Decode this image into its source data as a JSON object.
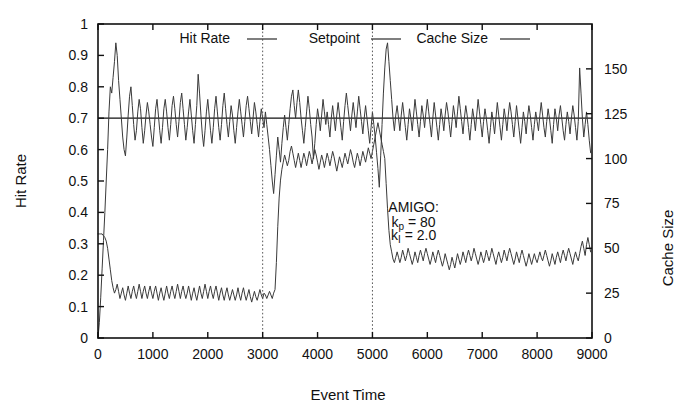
{
  "chart_data": {
    "type": "line",
    "title": "",
    "xlabel": "Event Time",
    "ylabel": "Hit Rate",
    "y2label": "Cache Size",
    "xlim": [
      0,
      9000
    ],
    "ylim": [
      0,
      1
    ],
    "y2lim": [
      0,
      175
    ],
    "xticks": [
      0,
      1000,
      2000,
      3000,
      4000,
      5000,
      6000,
      7000,
      8000,
      9000
    ],
    "xtick_labels": [
      "0",
      "1000",
      "2000",
      "3000",
      "4000",
      "5000",
      "6000",
      "7000",
      "8000",
      "9000"
    ],
    "yticks": [
      0,
      0.1,
      0.2,
      0.3,
      0.4,
      0.5,
      0.6,
      0.7,
      0.8,
      0.9,
      1
    ],
    "ytick_labels": [
      "0",
      "0.1",
      "0.2",
      "0.3",
      "0.4",
      "0.5",
      "0.6",
      "0.7",
      "0.8",
      "0.9",
      "1"
    ],
    "y2ticks": [
      0,
      25,
      50,
      75,
      100,
      125,
      150
    ],
    "y2tick_labels": [
      "0",
      "25",
      "50",
      "75",
      "100",
      "125",
      "150"
    ],
    "grid": false,
    "legend_position": "top-inside",
    "legend": [
      {
        "name": "Hit Rate",
        "marker": "line",
        "color": "#3a3a3a"
      },
      {
        "name": "Setpoint",
        "marker": "line",
        "color": "#111111"
      },
      {
        "name": "Cache Size",
        "marker": "line",
        "color": "#3a3a3a"
      }
    ],
    "annotations": [
      {
        "text": "AMIGO:",
        "x": 5750,
        "y": 0.4
      },
      {
        "text": "kp = 80",
        "x": 5750,
        "y": 0.355
      },
      {
        "text": "kI = 2.0",
        "x": 5750,
        "y": 0.312
      }
    ],
    "event_markers": [
      {
        "x": 3000,
        "style": "dotted"
      },
      {
        "x": 5000,
        "style": "dotted"
      }
    ],
    "setpoint_value": 0.7,
    "series": [
      {
        "name": "Setpoint",
        "axis": "left",
        "color": "#111111",
        "x": [
          0,
          9000
        ],
        "values": [
          0.7,
          0.7
        ]
      },
      {
        "name": "Hit Rate",
        "axis": "left",
        "color": "#3a3a3a",
        "x_start": 0,
        "x_step": 25,
        "values": [
          0.0,
          0.05,
          0.13,
          0.22,
          0.31,
          0.4,
          0.5,
          0.6,
          0.72,
          0.8,
          0.78,
          0.83,
          0.88,
          0.94,
          0.9,
          0.82,
          0.76,
          0.7,
          0.64,
          0.6,
          0.58,
          0.64,
          0.71,
          0.77,
          0.8,
          0.74,
          0.68,
          0.63,
          0.66,
          0.72,
          0.76,
          0.73,
          0.67,
          0.62,
          0.66,
          0.71,
          0.75,
          0.72,
          0.68,
          0.64,
          0.61,
          0.67,
          0.73,
          0.76,
          0.71,
          0.66,
          0.62,
          0.67,
          0.73,
          0.76,
          0.72,
          0.67,
          0.63,
          0.68,
          0.74,
          0.77,
          0.73,
          0.68,
          0.64,
          0.69,
          0.75,
          0.78,
          0.73,
          0.68,
          0.63,
          0.67,
          0.72,
          0.76,
          0.71,
          0.66,
          0.62,
          0.68,
          0.74,
          0.84,
          0.78,
          0.71,
          0.65,
          0.61,
          0.66,
          0.72,
          0.76,
          0.71,
          0.66,
          0.62,
          0.67,
          0.73,
          0.77,
          0.72,
          0.67,
          0.63,
          0.68,
          0.74,
          0.78,
          0.73,
          0.68,
          0.64,
          0.69,
          0.74,
          0.71,
          0.66,
          0.62,
          0.67,
          0.72,
          0.76,
          0.72,
          0.68,
          0.64,
          0.69,
          0.74,
          0.77,
          0.73,
          0.69,
          0.65,
          0.7,
          0.75,
          0.72,
          0.68,
          0.64,
          0.69,
          0.73,
          0.7,
          0.67,
          0.72,
          0.68,
          0.64,
          0.6,
          0.55,
          0.5,
          0.46,
          0.52,
          0.58,
          0.64,
          0.6,
          0.56,
          0.62,
          0.67,
          0.71,
          0.67,
          0.63,
          0.68,
          0.73,
          0.77,
          0.79,
          0.74,
          0.7,
          0.75,
          0.79,
          0.75,
          0.7,
          0.66,
          0.62,
          0.67,
          0.72,
          0.77,
          0.73,
          0.68,
          0.64,
          0.57,
          0.62,
          0.68,
          0.73,
          0.7,
          0.66,
          0.71,
          0.76,
          0.72,
          0.68,
          0.72,
          0.68,
          0.64,
          0.7,
          0.74,
          0.7,
          0.66,
          0.71,
          0.75,
          0.71,
          0.67,
          0.63,
          0.69,
          0.74,
          0.78,
          0.74,
          0.7,
          0.66,
          0.71,
          0.75,
          0.71,
          0.67,
          0.72,
          0.77,
          0.73,
          0.69,
          0.65,
          0.7,
          0.74,
          0.7,
          0.66,
          0.62,
          0.67,
          0.72,
          0.68,
          0.64,
          0.59,
          0.54,
          0.48,
          0.58,
          0.68,
          0.78,
          0.86,
          0.92,
          0.94,
          0.88,
          0.82,
          0.76,
          0.7,
          0.66,
          0.71,
          0.74,
          0.7,
          0.66,
          0.71,
          0.75,
          0.71,
          0.67,
          0.63,
          0.68,
          0.73,
          0.7,
          0.66,
          0.71,
          0.76,
          0.72,
          0.68,
          0.64,
          0.69,
          0.74,
          0.71,
          0.67,
          0.72,
          0.76,
          0.72,
          0.68,
          0.64,
          0.7,
          0.75,
          0.71,
          0.67,
          0.63,
          0.68,
          0.73,
          0.7,
          0.66,
          0.71,
          0.75,
          0.72,
          0.68,
          0.64,
          0.69,
          0.74,
          0.71,
          0.67,
          0.72,
          0.77,
          0.73,
          0.69,
          0.65,
          0.7,
          0.74,
          0.71,
          0.67,
          0.63,
          0.68,
          0.73,
          0.7,
          0.66,
          0.71,
          0.76,
          0.72,
          0.68,
          0.64,
          0.69,
          0.73,
          0.7,
          0.66,
          0.62,
          0.67,
          0.72,
          0.69,
          0.65,
          0.7,
          0.75,
          0.71,
          0.67,
          0.63,
          0.68,
          0.73,
          0.7,
          0.66,
          0.71,
          0.75,
          0.72,
          0.68,
          0.64,
          0.69,
          0.74,
          0.7,
          0.66,
          0.62,
          0.67,
          0.72,
          0.69,
          0.65,
          0.7,
          0.74,
          0.71,
          0.67,
          0.63,
          0.68,
          0.72,
          0.69,
          0.66,
          0.71,
          0.75,
          0.71,
          0.67,
          0.64,
          0.69,
          0.73,
          0.7,
          0.66,
          0.62,
          0.68,
          0.73,
          0.7,
          0.66,
          0.71,
          0.74,
          0.7,
          0.66,
          0.63,
          0.68,
          0.72,
          0.69,
          0.65,
          0.7,
          0.74,
          0.71,
          0.67,
          0.63,
          0.69,
          0.86,
          0.78,
          0.7,
          0.64,
          0.68,
          0.72,
          0.68,
          0.63,
          0.59
        ]
      },
      {
        "name": "Cache Size",
        "axis": "right",
        "color": "#3a3a3a",
        "x_start": 0,
        "x_step": 25,
        "values": [
          58,
          58,
          58,
          58,
          57,
          56,
          54,
          50,
          44,
          38,
          32,
          28,
          25,
          27,
          30,
          26,
          22,
          25,
          28,
          24,
          21,
          25,
          29,
          25,
          22,
          26,
          29,
          25,
          22,
          26,
          30,
          26,
          22,
          26,
          29,
          25,
          22,
          26,
          29,
          25,
          22,
          26,
          29,
          25,
          21,
          25,
          28,
          24,
          21,
          25,
          29,
          25,
          22,
          26,
          29,
          25,
          22,
          26,
          30,
          26,
          22,
          26,
          29,
          25,
          22,
          25,
          29,
          25,
          21,
          25,
          28,
          24,
          21,
          25,
          29,
          25,
          22,
          26,
          30,
          26,
          22,
          26,
          29,
          25,
          22,
          26,
          29,
          25,
          21,
          25,
          28,
          24,
          21,
          25,
          28,
          24,
          21,
          24,
          27,
          24,
          21,
          24,
          28,
          24,
          21,
          25,
          28,
          24,
          21,
          24,
          27,
          23,
          20,
          23,
          26,
          23,
          21,
          24,
          27,
          24,
          22,
          25,
          24,
          22,
          24,
          26,
          24,
          22,
          25,
          27,
          42,
          62,
          78,
          88,
          94,
          98,
          102,
          99,
          96,
          99,
          104,
          107,
          103,
          99,
          95,
          99,
          103,
          99,
          95,
          99,
          103,
          100,
          96,
          100,
          104,
          101,
          97,
          101,
          105,
          102,
          98,
          94,
          98,
          102,
          99,
          95,
          99,
          103,
          100,
          96,
          100,
          104,
          101,
          97,
          93,
          97,
          101,
          98,
          95,
          99,
          103,
          100,
          97,
          101,
          105,
          102,
          98,
          95,
          99,
          103,
          100,
          96,
          100,
          104,
          101,
          98,
          102,
          106,
          103,
          100,
          104,
          108,
          112,
          116,
          120,
          116,
          112,
          108,
          104,
          100,
          86,
          72,
          60,
          52,
          48,
          44,
          42,
          45,
          48,
          45,
          42,
          45,
          49,
          46,
          43,
          46,
          50,
          47,
          44,
          41,
          44,
          48,
          45,
          42,
          46,
          49,
          46,
          43,
          47,
          50,
          47,
          44,
          41,
          44,
          48,
          45,
          42,
          46,
          49,
          46,
          43,
          40,
          43,
          47,
          44,
          41,
          38,
          41,
          45,
          42,
          39,
          43,
          47,
          44,
          41,
          44,
          48,
          45,
          42,
          46,
          49,
          46,
          43,
          46,
          50,
          47,
          44,
          41,
          44,
          48,
          45,
          42,
          45,
          49,
          46,
          43,
          46,
          50,
          47,
          44,
          41,
          45,
          48,
          45,
          42,
          45,
          49,
          46,
          43,
          47,
          50,
          47,
          44,
          41,
          44,
          48,
          45,
          42,
          46,
          49,
          46,
          43,
          40,
          43,
          47,
          44,
          41,
          44,
          47,
          44,
          42,
          45,
          48,
          45,
          43,
          46,
          49,
          46,
          43,
          40,
          43,
          47,
          44,
          41,
          45,
          48,
          45,
          42,
          46,
          49,
          46,
          43,
          47,
          50,
          47,
          44,
          41,
          45,
          48,
          45,
          43,
          47,
          51,
          54,
          50,
          46,
          52,
          56,
          52,
          48
        ]
      }
    ]
  }
}
